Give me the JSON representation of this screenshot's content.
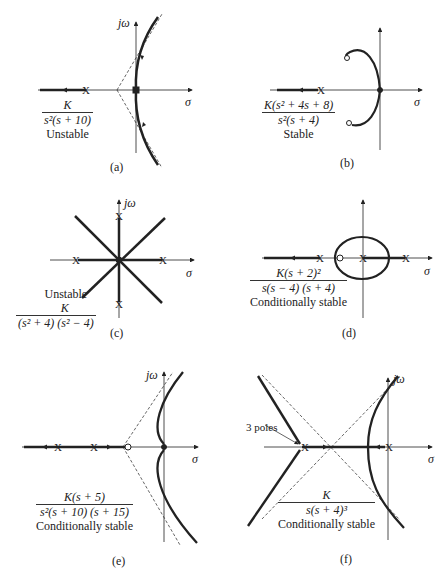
{
  "figure": {
    "panels": [
      {
        "id": "a",
        "caption": "(a)",
        "numerator": "K",
        "denominator": "s²(s + 10)",
        "stability": "Unstable"
      },
      {
        "id": "b",
        "caption": "(b)",
        "numerator": "K(s² + 4s + 8)",
        "denominator": "s²(s + 4)",
        "stability": "Stable"
      },
      {
        "id": "c",
        "caption": "(c)",
        "numerator": "K",
        "denominator": "(s² + 4) (s² − 4)",
        "stability": "Unstable"
      },
      {
        "id": "d",
        "caption": "(d)",
        "numerator": "K(s + 2)²",
        "denominator": "s(s − 4) (s + 4)",
        "stability": "Conditionally stable"
      },
      {
        "id": "e",
        "caption": "(e)",
        "numerator": "K(s + 5)",
        "denominator": "s²(s + 10) (s + 15)",
        "stability": "Conditionally stable"
      },
      {
        "id": "f",
        "caption": "(f)",
        "numerator": "K",
        "denominator": "s(s + 4)³",
        "stability": "Conditionally stable",
        "annotation": "3 poles"
      }
    ],
    "axis_labels": {
      "imag": "jω",
      "real": "σ"
    }
  }
}
